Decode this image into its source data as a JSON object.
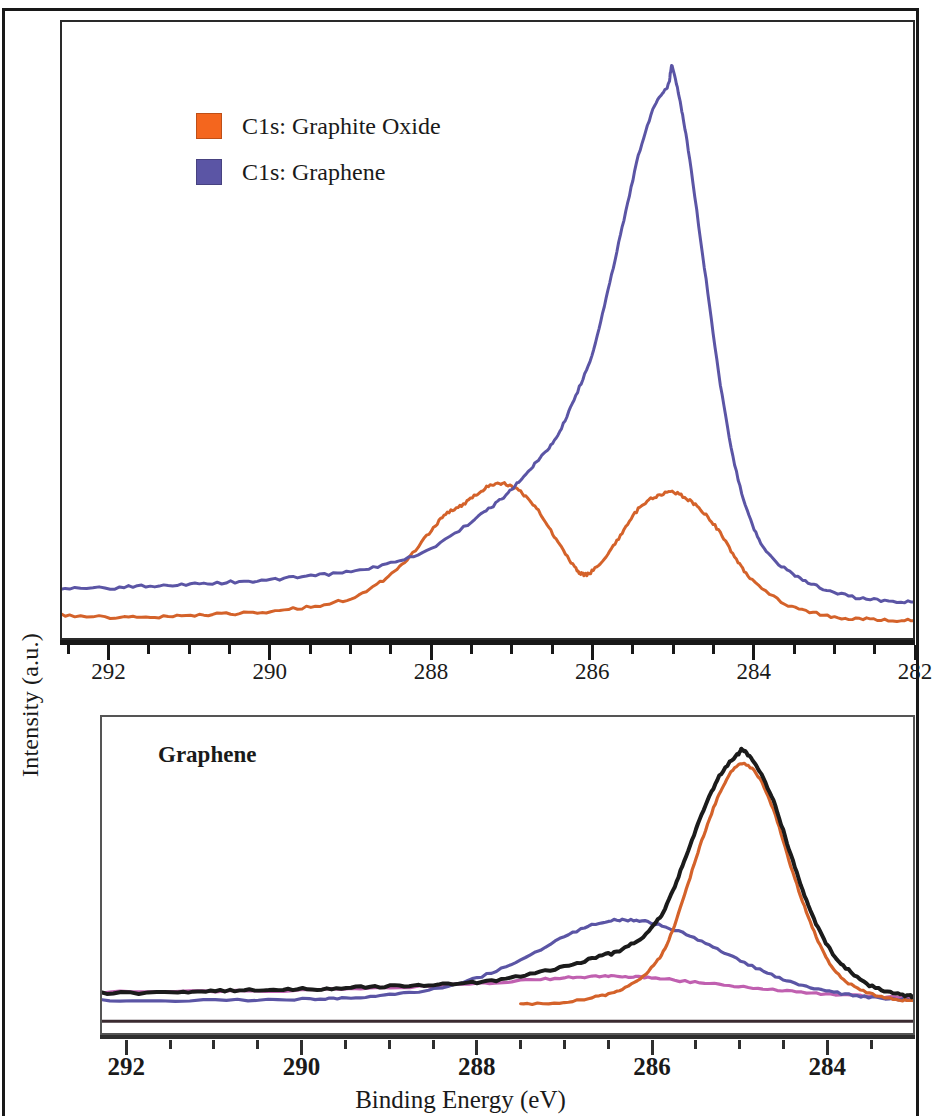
{
  "figure": {
    "axis_titles": {
      "y": "Intensity (a.u.)",
      "x": "Binding Energy (eV)"
    }
  },
  "legend": {
    "items": [
      {
        "label": "C1s: Graphite Oxide",
        "color": "#F4661E"
      },
      {
        "label": "C1s: Graphene",
        "color": "#5B55A5"
      }
    ]
  },
  "annotations": {
    "bottom_panel_label": "Graphene"
  },
  "top_panel": {
    "ticks": [
      "292",
      "290",
      "288",
      "286",
      "284",
      "282"
    ]
  },
  "bottom_panel": {
    "ticks": [
      "292",
      "290",
      "288",
      "286",
      "284"
    ]
  },
  "chart_data": [
    {
      "type": "line",
      "title": "C1s XPS spectra: Graphite Oxide vs Graphene",
      "xlabel": "Binding Energy (eV)",
      "ylabel": "Intensity (a.u.)",
      "xlim": [
        292.6,
        282.0
      ],
      "x_axis_reversed": true,
      "xticks": [
        292,
        290,
        288,
        286,
        284,
        282
      ],
      "ylim": [
        0,
        1
      ],
      "yticks": [],
      "grid": false,
      "legend_position": "upper-left",
      "series": [
        {
          "name": "C1s: Graphite Oxide",
          "color": "#D4622A",
          "peaks": [
            {
              "binding_energy": 287.2,
              "intensity": 0.25,
              "assignment": "C-O epoxy/hydroxyl"
            },
            {
              "binding_energy": 285.0,
              "intensity": 0.235,
              "assignment": "C-C sp2"
            }
          ],
          "valley": {
            "binding_energy": 286.1,
            "intensity": 0.095
          },
          "baseline_intensity": 0.02,
          "x": [
            292.6,
            292.0,
            291.5,
            291.0,
            290.5,
            290.0,
            289.5,
            289.0,
            288.6,
            288.3,
            288.0,
            287.8,
            287.6,
            287.4,
            287.2,
            287.0,
            286.8,
            286.6,
            286.4,
            286.2,
            286.1,
            286.0,
            285.8,
            285.6,
            285.4,
            285.2,
            285.0,
            284.8,
            284.6,
            284.4,
            284.2,
            284.0,
            283.6,
            283.2,
            282.8,
            282.4,
            282.0
          ],
          "y": [
            0.025,
            0.022,
            0.022,
            0.025,
            0.028,
            0.032,
            0.04,
            0.055,
            0.085,
            0.12,
            0.17,
            0.2,
            0.215,
            0.235,
            0.25,
            0.245,
            0.225,
            0.19,
            0.145,
            0.105,
            0.095,
            0.1,
            0.13,
            0.17,
            0.21,
            0.228,
            0.235,
            0.222,
            0.2,
            0.165,
            0.12,
            0.085,
            0.045,
            0.028,
            0.02,
            0.018,
            0.016
          ]
        },
        {
          "name": "C1s: Graphene",
          "color": "#5B55A5",
          "peaks": [
            {
              "binding_energy": 285.0,
              "intensity": 0.96,
              "assignment": "C-C sp2"
            }
          ],
          "shoulder": {
            "binding_energy": 286.3,
            "intensity": 0.33
          },
          "baseline_intensity": 0.07,
          "x": [
            292.6,
            292.0,
            291.5,
            291.0,
            290.5,
            290.0,
            289.5,
            289.0,
            288.5,
            288.0,
            287.5,
            287.2,
            287.0,
            286.8,
            286.6,
            286.4,
            286.2,
            286.0,
            285.8,
            285.6,
            285.4,
            285.2,
            285.05,
            285.0,
            284.9,
            284.8,
            284.6,
            284.4,
            284.2,
            284.0,
            283.8,
            283.5,
            283.2,
            282.8,
            282.4,
            282.0
          ],
          "y": [
            0.07,
            0.072,
            0.075,
            0.078,
            0.082,
            0.086,
            0.092,
            0.1,
            0.115,
            0.14,
            0.185,
            0.215,
            0.24,
            0.27,
            0.3,
            0.34,
            0.4,
            0.47,
            0.58,
            0.7,
            0.82,
            0.9,
            0.93,
            0.96,
            0.9,
            0.82,
            0.62,
            0.42,
            0.27,
            0.18,
            0.13,
            0.095,
            0.075,
            0.058,
            0.05,
            0.048
          ]
        }
      ]
    },
    {
      "type": "line",
      "title": "Graphene C1s peak fit",
      "xlabel": "Binding Energy (eV)",
      "ylabel": "Intensity (a.u.)",
      "xlim": [
        292.3,
        283.0
      ],
      "x_axis_reversed": true,
      "xticks": [
        292,
        290,
        288,
        286,
        284
      ],
      "ylim": [
        0,
        1
      ],
      "yticks": [],
      "grid": false,
      "annotation": "Graphene",
      "series": [
        {
          "name": "envelope",
          "color": "#1b1b1b",
          "role": "fitted envelope / raw data",
          "peaks": [
            {
              "binding_energy": 284.95,
              "intensity": 0.93
            }
          ],
          "x": [
            292.3,
            291.5,
            291.0,
            290.5,
            290.0,
            289.5,
            289.0,
            288.5,
            288.0,
            287.5,
            287.0,
            286.6,
            286.3,
            286.0,
            285.8,
            285.6,
            285.4,
            285.2,
            285.0,
            284.95,
            284.8,
            284.6,
            284.4,
            284.2,
            284.0,
            283.8,
            283.5,
            283.2,
            283.0
          ],
          "y": [
            0.07,
            0.075,
            0.078,
            0.082,
            0.085,
            0.09,
            0.095,
            0.1,
            0.11,
            0.13,
            0.165,
            0.2,
            0.23,
            0.3,
            0.4,
            0.56,
            0.72,
            0.85,
            0.92,
            0.93,
            0.88,
            0.75,
            0.56,
            0.38,
            0.25,
            0.17,
            0.1,
            0.07,
            0.06
          ]
        },
        {
          "name": "sp2 C-C component",
          "color": "#D4622A",
          "role": "fit component",
          "peaks": [
            {
              "binding_energy": 285.0,
              "intensity": 0.88
            }
          ],
          "x": [
            287.5,
            287.0,
            286.6,
            286.3,
            286.0,
            285.8,
            285.6,
            285.4,
            285.2,
            285.0,
            284.8,
            284.6,
            284.4,
            284.2,
            284.0,
            283.8,
            283.5,
            283.2,
            283.0
          ],
          "y": [
            0.03,
            0.04,
            0.06,
            0.09,
            0.16,
            0.26,
            0.44,
            0.63,
            0.79,
            0.88,
            0.85,
            0.72,
            0.52,
            0.34,
            0.2,
            0.12,
            0.07,
            0.05,
            0.045
          ]
        },
        {
          "name": "C-O component",
          "color": "#5B55A5",
          "role": "fit component",
          "peaks": [
            {
              "binding_energy": 286.3,
              "intensity": 0.33
            }
          ],
          "x": [
            292.3,
            291.0,
            290.0,
            289.5,
            289.0,
            288.5,
            288.0,
            287.5,
            287.0,
            286.6,
            286.3,
            286.0,
            285.6,
            285.2,
            284.8,
            284.4,
            284.0,
            283.6,
            283.2,
            283.0
          ],
          "y": [
            0.045,
            0.046,
            0.05,
            0.055,
            0.065,
            0.085,
            0.125,
            0.19,
            0.27,
            0.32,
            0.33,
            0.32,
            0.28,
            0.22,
            0.16,
            0.11,
            0.08,
            0.06,
            0.05,
            0.048
          ]
        },
        {
          "name": "background / residual",
          "color": "#C060B0",
          "role": "background",
          "x": [
            292.3,
            291.0,
            290.0,
            289.0,
            288.0,
            287.5,
            287.0,
            286.6,
            286.3,
            286.0,
            285.5,
            285.0,
            284.5,
            284.0,
            283.5,
            283.0
          ],
          "y": [
            0.075,
            0.078,
            0.082,
            0.09,
            0.105,
            0.115,
            0.125,
            0.13,
            0.13,
            0.125,
            0.11,
            0.095,
            0.08,
            0.068,
            0.06,
            0.056
          ]
        }
      ]
    }
  ]
}
